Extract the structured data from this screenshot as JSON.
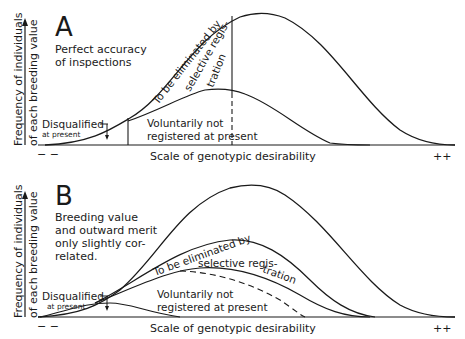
{
  "panels": [
    {
      "letter": "A",
      "description": [
        "Perfect accuracy",
        "of inspections"
      ],
      "y_axis_label": [
        "Frequency of individuals",
        "of each breeding value"
      ],
      "x_axis_label": "Scale of genotypic desirability",
      "x_left": "− −",
      "x_right": "++",
      "regions": {
        "disqualified": "Disqualified",
        "disqualified_sub": "at present",
        "voluntary": [
          "Voluntarily not",
          "registered at present"
        ],
        "eliminated": [
          "To be eliminated by",
          "selective regis-",
          "tration"
        ]
      }
    },
    {
      "letter": "B",
      "description": [
        "Breeding value",
        "and outward merit",
        "only slightly cor-",
        "related."
      ],
      "y_axis_label": [
        "Frequency of individuals",
        "of each breeding value"
      ],
      "x_axis_label": "Scale of genotypic desirability",
      "x_left": "− −",
      "x_right": "++",
      "regions": {
        "disqualified": "Disqualified",
        "disqualified_sub": "at present",
        "voluntary": [
          "Voluntarily not",
          "registered at present"
        ],
        "eliminated": [
          "To be eliminated by",
          "selective regis-",
          "tration"
        ]
      }
    }
  ]
}
